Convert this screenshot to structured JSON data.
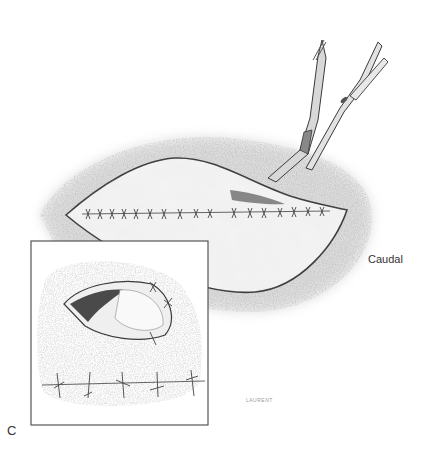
{
  "figure": {
    "panel_label": "C",
    "orientation_label": "Caudal",
    "artist_signature": "LAURENT"
  },
  "colors": {
    "background": "#ffffff",
    "line": "#3a3a3a",
    "fur": "#8a8a8a",
    "skin": "#f2f2f2",
    "inset_border": "#555555"
  },
  "inset": {
    "x": 31,
    "y": 241,
    "width": 177,
    "height": 184
  }
}
